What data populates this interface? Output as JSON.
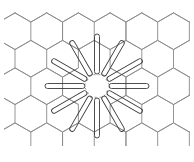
{
  "diagram": {
    "title": "",
    "type": "hexagonal-lattice-with-radial-loops",
    "lattice": {
      "orientation": "pointy-top",
      "hex_width": 31.7,
      "row_spacing": 27.5,
      "color": "#8a8a8a"
    },
    "center": {
      "x": 97,
      "y": 86,
      "core_radius": 13
    },
    "petals": {
      "count": 12,
      "angle_step_deg": 30,
      "inner_radius": 12,
      "outer_radius": 52,
      "width": 5,
      "color": "#3a3a3a"
    },
    "background": "#ffffff"
  }
}
